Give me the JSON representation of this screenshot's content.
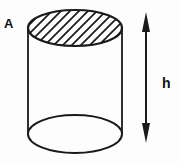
{
  "figure": {
    "labels": {
      "top_face": "A",
      "height": "h"
    },
    "colors": {
      "line": "#1a1a1a",
      "background": "#fdfdfd"
    }
  }
}
